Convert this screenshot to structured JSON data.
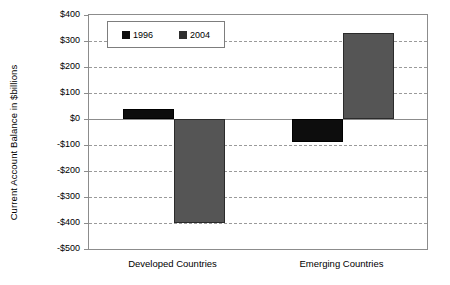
{
  "chart_data": {
    "type": "bar",
    "title": "",
    "xlabel": "",
    "ylabel": "Current Account Balance in $billions",
    "categories": [
      "Developed Countries",
      "Emerging Countries"
    ],
    "series": [
      {
        "name": "1996",
        "color": "#0d0d0d",
        "values": [
          40,
          -90
        ]
      },
      {
        "name": "2004",
        "color": "#555555",
        "values": [
          -400,
          330
        ]
      }
    ],
    "ylim": [
      -500,
      400
    ],
    "ytick_values": [
      400,
      300,
      200,
      100,
      0,
      -100,
      -200,
      -300,
      -400,
      -500
    ],
    "ytick_labels": [
      "$400",
      "$300",
      "$200",
      "$100",
      "$0",
      "-$100",
      "-$200",
      "-$300",
      "-$400",
      "-$500"
    ],
    "grid": true,
    "grid_axis": "y",
    "grid_style": "dashed",
    "legend_position": "upper left",
    "legend_entries": [
      "1996",
      "2004"
    ],
    "zero_line": 0
  }
}
